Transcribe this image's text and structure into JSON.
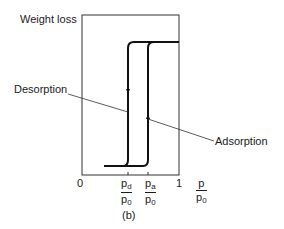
{
  "figure": {
    "y_axis_label": "Weight loss",
    "curve_labels": {
      "desorption": "Desorption",
      "adsorption": "Adsorption"
    },
    "x_ticks": {
      "zero": "0",
      "one": "1"
    },
    "pd_fraction": {
      "num": "p",
      "num_sub": "d",
      "den": "p",
      "den_sub": "0"
    },
    "pa_fraction": {
      "num": "p",
      "num_sub": "a",
      "den": "p",
      "den_sub": "0"
    },
    "x_axis_fraction": {
      "num": "p",
      "den": "p",
      "den_sub": "0"
    },
    "caption": "(b)"
  }
}
